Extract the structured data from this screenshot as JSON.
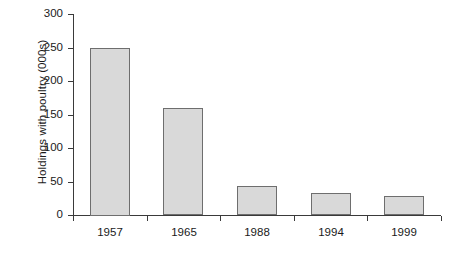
{
  "chart_data": {
    "type": "bar",
    "title": "",
    "subtitle": "",
    "xlabel": "",
    "ylabel": "Holdings with poultry (000s)",
    "categories": [
      "1957",
      "1965",
      "1988",
      "1994",
      "1999"
    ],
    "values": [
      250,
      159,
      43,
      33,
      28
    ],
    "series": [
      {
        "name": "Holdings with poultry",
        "values": [
          250,
          159,
          43,
          33,
          28
        ]
      }
    ],
    "ylim": [
      0,
      300
    ],
    "yticks": [
      0,
      50,
      100,
      150,
      200,
      250,
      300
    ],
    "ytick_labels": [
      "0",
      "50",
      "100",
      "150",
      "200",
      "250",
      "300"
    ],
    "grid": false,
    "legend": false,
    "legend_position": "none",
    "bar_fill_color": "#d9d9d9",
    "bar_border_color": "#6e6e6e",
    "axis_color": "#3a3a3a",
    "background_color": "#ffffff",
    "annotations": []
  }
}
